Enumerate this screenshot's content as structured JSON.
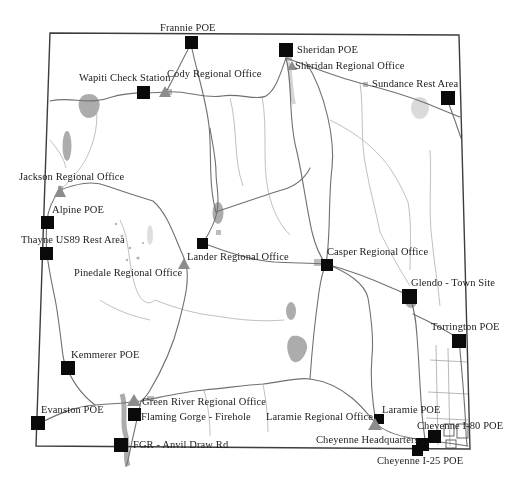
{
  "figure": {
    "type": "state-highway-map",
    "region": "Wyoming",
    "background": "#ffffff"
  },
  "colors": {
    "state_border": "#3d3d3d",
    "road_major": "#707070",
    "road_minor": "#b0b0b0",
    "water": "#989898",
    "marker_square": "#0a0a0a",
    "marker_triangle": "#8c8c8c",
    "label_text": "#1c1c1c"
  },
  "marker_legend": {
    "square": "black-square site marker",
    "triangle": "gray-triangle site marker"
  },
  "sites": [
    {
      "label": "Frannie POE",
      "marker": "square"
    },
    {
      "label": "Sheridan POE",
      "marker": "square"
    },
    {
      "label": "Sheridan Regional Office",
      "marker": "triangle"
    },
    {
      "label": "Wapiti Check Station",
      "marker": "square"
    },
    {
      "label": "Cody Regional Office",
      "marker": "triangle"
    },
    {
      "label": "Sundance Rest Area",
      "marker": "square"
    },
    {
      "label": "Jackson Regional Office",
      "marker": "triangle"
    },
    {
      "label": "Alpine POE",
      "marker": "square"
    },
    {
      "label": "Thayne US89 Rest Area",
      "marker": "square"
    },
    {
      "label": "Pinedale Regional Office",
      "marker": "triangle"
    },
    {
      "label": "Lander Regional Office",
      "marker": "square"
    },
    {
      "label": "Casper Regional Office",
      "marker": "square"
    },
    {
      "label": "Glendo - Town Site",
      "marker": "square"
    },
    {
      "label": "Torrington POE",
      "marker": "square"
    },
    {
      "label": "Kemmerer POE",
      "marker": "square"
    },
    {
      "label": "Evanston POE",
      "marker": "square"
    },
    {
      "label": "Green River Regional Office",
      "marker": "triangle"
    },
    {
      "label": "Flaming Gorge - Firehole",
      "marker": "square"
    },
    {
      "label": "FGR - Anvil Draw Rd",
      "marker": "square"
    },
    {
      "label": "Laramie Regional Office",
      "marker": "triangle"
    },
    {
      "label": "Laramie POE",
      "marker": "square"
    },
    {
      "label": "Cheyenne I-80 POE",
      "marker": "square"
    },
    {
      "label": "Cheyenne Headquarters",
      "marker": "square"
    },
    {
      "label": "Cheyenne I-25 POE",
      "marker": "square"
    }
  ]
}
